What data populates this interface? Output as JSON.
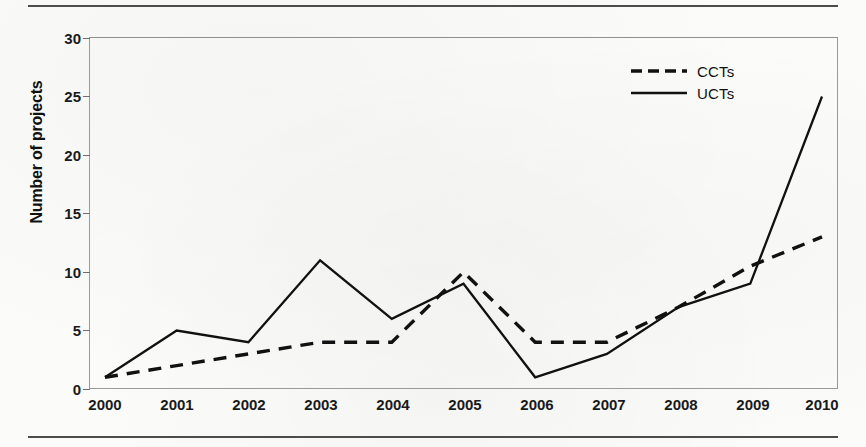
{
  "chart_data": {
    "type": "line",
    "title": "",
    "xlabel": "",
    "ylabel": "Number of projects",
    "categories": [
      "2000",
      "2001",
      "2002",
      "2003",
      "2004",
      "2005",
      "2006",
      "2007",
      "2008",
      "2009",
      "2010"
    ],
    "x": [
      2000,
      2001,
      2002,
      2003,
      2004,
      2005,
      2006,
      2007,
      2008,
      2009,
      2010
    ],
    "ylim": [
      0,
      30
    ],
    "yticks": [
      0,
      5,
      10,
      15,
      20,
      25,
      30
    ],
    "grid": false,
    "legend_position": "top-right",
    "series": [
      {
        "name": "CCTs",
        "style": "dashed",
        "color": "#111111",
        "values": [
          1,
          2,
          3,
          4,
          4,
          10,
          4,
          4,
          7,
          10.5,
          13
        ]
      },
      {
        "name": "UCTs",
        "style": "solid",
        "color": "#111111",
        "values": [
          1,
          5,
          4,
          11,
          6,
          9,
          1,
          3,
          7,
          9,
          25
        ]
      }
    ]
  },
  "axes": {
    "y_title": "Number of projects",
    "y_tick_labels": [
      "0",
      "5",
      "10",
      "15",
      "20",
      "25",
      "30"
    ],
    "x_tick_labels": [
      "2000",
      "2001",
      "2002",
      "2003",
      "2004",
      "2005",
      "2006",
      "2007",
      "2008",
      "2009",
      "2010"
    ]
  },
  "legend": {
    "items": [
      {
        "label": "CCTs",
        "style": "dashed"
      },
      {
        "label": "UCTs",
        "style": "solid"
      }
    ]
  },
  "colors": {
    "ink": "#111111",
    "frame": "#9a9a9a",
    "rule": "#4c4c4c",
    "paper": "#fbfbfa"
  }
}
